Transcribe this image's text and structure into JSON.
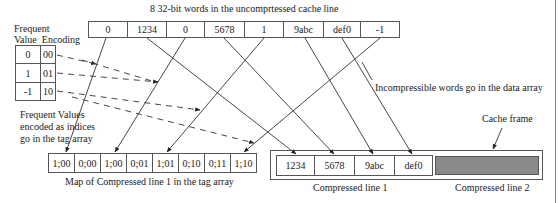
{
  "title": "8 32-bit words in the uncomprtessed cache line",
  "uncompressed_line": [
    "0",
    "1234",
    "0",
    "5678",
    "1",
    "9abc",
    "def0",
    "-1"
  ],
  "frequent_value_table": {
    "header_line1": "Frequent",
    "header_line2": "Value  Encoding",
    "rows": [
      {
        "value": "0",
        "encoding": "00"
      },
      {
        "value": "1",
        "encoding": "01"
      },
      {
        "value": "-1",
        "encoding": "10"
      }
    ]
  },
  "notes": {
    "frequent_values_line1": "Frequent Values",
    "frequent_values_line2": "encoded as indices",
    "frequent_values_line3": "go in the tag array",
    "incompressible": "Incompressible words go in the data array",
    "cache_frame": "Cache frame"
  },
  "tag_array": {
    "cells": [
      "1;00",
      "0;00",
      "1;00",
      "0;01",
      "1;01",
      "0;10",
      "0;11",
      "1;10"
    ],
    "caption": "Map of Compressed line 1 in the tag array"
  },
  "cache_frame": {
    "compressed_line1": [
      "1234",
      "5678",
      "9abc",
      "def0"
    ],
    "caption_line1": "Compressed line 1",
    "caption_line2": "Compressed line 2",
    "line2_fill": "#8a8a8a"
  }
}
